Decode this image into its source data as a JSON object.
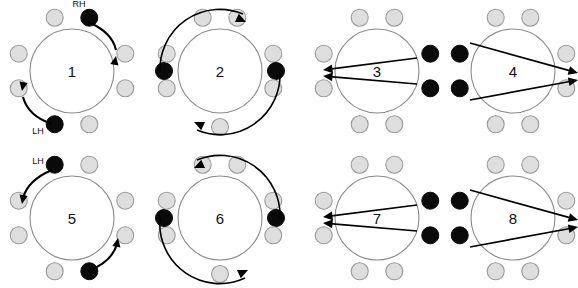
{
  "figure": {
    "type": "diagram",
    "canvas": {
      "width": 578,
      "height": 288
    },
    "colors": {
      "background": "#ffffff",
      "ring_stroke": "#8a8a8a",
      "marker_inactive_fill": "#dedede",
      "marker_inactive_stroke": "#9a9a9a",
      "marker_active_fill": "#0a0a0a",
      "arrow_stroke": "#000000",
      "label_text": "#111111"
    },
    "legend_terms": {
      "RH": "RH",
      "LH": "LH"
    }
  },
  "panels": [
    {
      "id": "panel-1",
      "number": "1",
      "x": 0,
      "y": 0,
      "w": 145,
      "h": 144,
      "cx": 72,
      "cy": 71,
      "r": 42,
      "markers": [
        {
          "name": "marker-top-left",
          "angle": -108,
          "state": "inactive"
        },
        {
          "name": "marker-top-right",
          "angle": -72,
          "state": "active"
        },
        {
          "name": "marker-right-upper",
          "angle": -18,
          "state": "inactive"
        },
        {
          "name": "marker-right-lower",
          "angle": 18,
          "state": "inactive"
        },
        {
          "name": "marker-bottom-right",
          "angle": 72,
          "state": "inactive"
        },
        {
          "name": "marker-bottom-left",
          "angle": 108,
          "state": "active"
        },
        {
          "name": "marker-left-lower",
          "angle": 162,
          "state": "inactive"
        },
        {
          "name": "marker-left-upper",
          "angle": 198,
          "state": "inactive"
        }
      ],
      "labels": [
        {
          "name": "label-rh",
          "text": "RH",
          "x": 79,
          "y": 4
        },
        {
          "name": "label-lh",
          "text": "LH",
          "x": 38,
          "y": 131
        }
      ],
      "arrows": [
        {
          "name": "arrow-rh-clockwise",
          "kind": "short-curve",
          "path": "M 88 22 Q 112 32 116 50",
          "head": [
            116,
            56,
            0.18,
            -1
          ]
        },
        {
          "name": "arrow-lh-clockwise",
          "kind": "short-curve",
          "path": "M 52 124 Q 28 116 23 97",
          "head": [
            22,
            91,
            -0.18,
            1
          ]
        }
      ]
    },
    {
      "id": "panel-2",
      "number": "2",
      "x": 145,
      "y": 0,
      "w": 160,
      "h": 144,
      "cx": 75,
      "cy": 71,
      "r": 42,
      "markers": [
        {
          "name": "marker-top-left",
          "angle": -108,
          "state": "inactive"
        },
        {
          "name": "marker-top-right",
          "angle": -72,
          "state": "inactive"
        },
        {
          "name": "marker-right-upper",
          "angle": -18,
          "state": "inactive"
        },
        {
          "name": "marker-right-middle",
          "angle": 0,
          "state": "active"
        },
        {
          "name": "marker-right-lower",
          "angle": 18,
          "state": "inactive"
        },
        {
          "name": "marker-bottom",
          "angle": 90,
          "state": "inactive"
        },
        {
          "name": "marker-left-lower",
          "angle": 162,
          "state": "inactive"
        },
        {
          "name": "marker-left-middle",
          "angle": 180,
          "state": "active"
        },
        {
          "name": "marker-left-upper",
          "angle": 198,
          "state": "inactive"
        }
      ],
      "labels": [],
      "arrows": [
        {
          "name": "arrow-outer-upper-sweep",
          "kind": "band",
          "path": "M 15 72 A 60 60 0 0 1 98 14",
          "head": [
            101,
            22,
            1,
            0.45
          ]
        },
        {
          "name": "arrow-outer-lower-sweep",
          "kind": "band",
          "path": "M 135 72 A 60 60 0 0 1 52 130",
          "head": [
            49,
            122,
            -1,
            -0.45
          ]
        }
      ]
    },
    {
      "id": "panel-3",
      "number": "3",
      "x": 305,
      "y": 0,
      "w": 140,
      "h": 144,
      "cx": 72,
      "cy": 71,
      "r": 42,
      "markers": [
        {
          "name": "marker-top-left",
          "angle": -108,
          "state": "inactive"
        },
        {
          "name": "marker-top-right",
          "angle": -72,
          "state": "inactive"
        },
        {
          "name": "marker-right-upper",
          "angle": -18,
          "state": "active"
        },
        {
          "name": "marker-right-lower",
          "angle": 18,
          "state": "active"
        },
        {
          "name": "marker-bottom-right",
          "angle": 72,
          "state": "inactive"
        },
        {
          "name": "marker-bottom-left",
          "angle": 108,
          "state": "inactive"
        },
        {
          "name": "marker-left-lower",
          "angle": 162,
          "state": "inactive"
        },
        {
          "name": "marker-left-upper",
          "angle": 198,
          "state": "inactive"
        }
      ],
      "labels": [],
      "arrows": [
        {
          "name": "arrow-upper-to-left",
          "kind": "straight",
          "from": [
            112,
            58
          ],
          "to": [
            18,
            70
          ]
        },
        {
          "name": "arrow-lower-to-left",
          "kind": "straight",
          "from": [
            112,
            84
          ],
          "to": [
            18,
            76
          ]
        }
      ]
    },
    {
      "id": "panel-4",
      "number": "4",
      "x": 445,
      "y": 0,
      "w": 133,
      "h": 144,
      "cx": 68,
      "cy": 71,
      "r": 42,
      "markers": [
        {
          "name": "marker-top-left",
          "angle": -108,
          "state": "inactive"
        },
        {
          "name": "marker-top-right",
          "angle": -72,
          "state": "inactive"
        },
        {
          "name": "marker-right-upper",
          "angle": -18,
          "state": "inactive"
        },
        {
          "name": "marker-right-lower",
          "angle": 18,
          "state": "inactive"
        },
        {
          "name": "marker-bottom-right",
          "angle": 72,
          "state": "inactive"
        },
        {
          "name": "marker-bottom-left",
          "angle": 108,
          "state": "inactive"
        },
        {
          "name": "marker-left-lower",
          "angle": 162,
          "state": "active"
        },
        {
          "name": "marker-left-upper",
          "angle": 198,
          "state": "active"
        }
      ],
      "labels": [],
      "arrows": [
        {
          "name": "arrow-upper-to-right",
          "kind": "straight",
          "from": [
            25,
            43
          ],
          "to": [
            133,
            73
          ]
        },
        {
          "name": "arrow-lower-to-right",
          "kind": "straight",
          "from": [
            25,
            100
          ],
          "to": [
            133,
            80
          ]
        }
      ]
    },
    {
      "id": "panel-5",
      "number": "5",
      "x": 0,
      "y": 144,
      "w": 145,
      "h": 144,
      "cx": 72,
      "cy": 74,
      "r": 42,
      "markers": [
        {
          "name": "marker-top-left",
          "angle": -108,
          "state": "active"
        },
        {
          "name": "marker-top-right",
          "angle": -72,
          "state": "inactive"
        },
        {
          "name": "marker-right-upper",
          "angle": -18,
          "state": "inactive"
        },
        {
          "name": "marker-right-lower",
          "angle": 18,
          "state": "inactive"
        },
        {
          "name": "marker-bottom-right",
          "angle": 72,
          "state": "active"
        },
        {
          "name": "marker-bottom-left",
          "angle": 108,
          "state": "inactive"
        },
        {
          "name": "marker-left-lower",
          "angle": 162,
          "state": "inactive"
        },
        {
          "name": "marker-left-upper",
          "angle": 198,
          "state": "inactive"
        }
      ],
      "labels": [
        {
          "name": "label-lh",
          "text": "LH",
          "x": 38,
          "y": 17
        }
      ],
      "arrows": [
        {
          "name": "arrow-lh-counterclockwise",
          "kind": "short-curve",
          "path": "M 52 26 Q 28 36 23 54",
          "head": [
            22,
            60,
            -0.18,
            1
          ]
        },
        {
          "name": "arrow-rh-counterclockwise",
          "kind": "short-curve",
          "path": "M 88 127 Q 112 118 117 100",
          "head": [
            118,
            94,
            0.18,
            -1
          ]
        }
      ]
    },
    {
      "id": "panel-6",
      "number": "6",
      "x": 145,
      "y": 144,
      "w": 160,
      "h": 144,
      "cx": 75,
      "cy": 74,
      "r": 42,
      "markers": [
        {
          "name": "marker-top-left",
          "angle": -108,
          "state": "inactive"
        },
        {
          "name": "marker-top-right",
          "angle": -72,
          "state": "inactive"
        },
        {
          "name": "marker-right-upper",
          "angle": -18,
          "state": "inactive"
        },
        {
          "name": "marker-right-middle",
          "angle": 0,
          "state": "active"
        },
        {
          "name": "marker-right-lower",
          "angle": 18,
          "state": "inactive"
        },
        {
          "name": "marker-bottom",
          "angle": 90,
          "state": "inactive"
        },
        {
          "name": "marker-left-lower",
          "angle": 162,
          "state": "inactive"
        },
        {
          "name": "marker-left-middle",
          "angle": 180,
          "state": "active"
        },
        {
          "name": "marker-left-upper",
          "angle": 198,
          "state": "inactive"
        }
      ],
      "labels": [],
      "arrows": [
        {
          "name": "arrow-outer-upper-sweep",
          "kind": "band",
          "path": "M 135 74 A 60 60 0 0 0 52 16",
          "head": [
            49,
            24,
            -1,
            0.45
          ]
        },
        {
          "name": "arrow-outer-lower-sweep",
          "kind": "band",
          "path": "M 15 74 A 60 60 0 0 0 100 134",
          "head": [
            103,
            126,
            1,
            -0.45
          ]
        }
      ]
    },
    {
      "id": "panel-7",
      "number": "7",
      "x": 305,
      "y": 144,
      "w": 140,
      "h": 144,
      "cx": 72,
      "cy": 74,
      "r": 42,
      "markers": [
        {
          "name": "marker-top-left",
          "angle": -108,
          "state": "inactive"
        },
        {
          "name": "marker-top-right",
          "angle": -72,
          "state": "inactive"
        },
        {
          "name": "marker-right-upper",
          "angle": -18,
          "state": "active"
        },
        {
          "name": "marker-right-lower",
          "angle": 18,
          "state": "active"
        },
        {
          "name": "marker-bottom-right",
          "angle": 72,
          "state": "inactive"
        },
        {
          "name": "marker-bottom-left",
          "angle": 108,
          "state": "inactive"
        },
        {
          "name": "marker-left-lower",
          "angle": 162,
          "state": "inactive"
        },
        {
          "name": "marker-left-upper",
          "angle": 198,
          "state": "inactive"
        }
      ],
      "labels": [],
      "arrows": [
        {
          "name": "arrow-upper-to-left",
          "kind": "straight",
          "from": [
            112,
            61
          ],
          "to": [
            18,
            73
          ]
        },
        {
          "name": "arrow-lower-to-left",
          "kind": "straight",
          "from": [
            112,
            87
          ],
          "to": [
            18,
            79
          ]
        }
      ]
    },
    {
      "id": "panel-8",
      "number": "8",
      "x": 445,
      "y": 144,
      "w": 133,
      "h": 144,
      "cx": 68,
      "cy": 74,
      "r": 42,
      "markers": [
        {
          "name": "marker-top-left",
          "angle": -108,
          "state": "inactive"
        },
        {
          "name": "marker-top-right",
          "angle": -72,
          "state": "inactive"
        },
        {
          "name": "marker-right-upper",
          "angle": -18,
          "state": "inactive"
        },
        {
          "name": "marker-right-lower",
          "angle": 18,
          "state": "inactive"
        },
        {
          "name": "marker-bottom-right",
          "angle": 72,
          "state": "inactive"
        },
        {
          "name": "marker-bottom-left",
          "angle": 108,
          "state": "inactive"
        },
        {
          "name": "marker-left-lower",
          "angle": 162,
          "state": "active"
        },
        {
          "name": "marker-left-upper",
          "angle": 198,
          "state": "active"
        }
      ],
      "labels": [],
      "arrows": [
        {
          "name": "arrow-upper-to-right",
          "kind": "straight",
          "from": [
            25,
            46
          ],
          "to": [
            133,
            76
          ]
        },
        {
          "name": "arrow-lower-to-right",
          "kind": "straight",
          "from": [
            25,
            103
          ],
          "to": [
            133,
            83
          ]
        }
      ]
    }
  ]
}
